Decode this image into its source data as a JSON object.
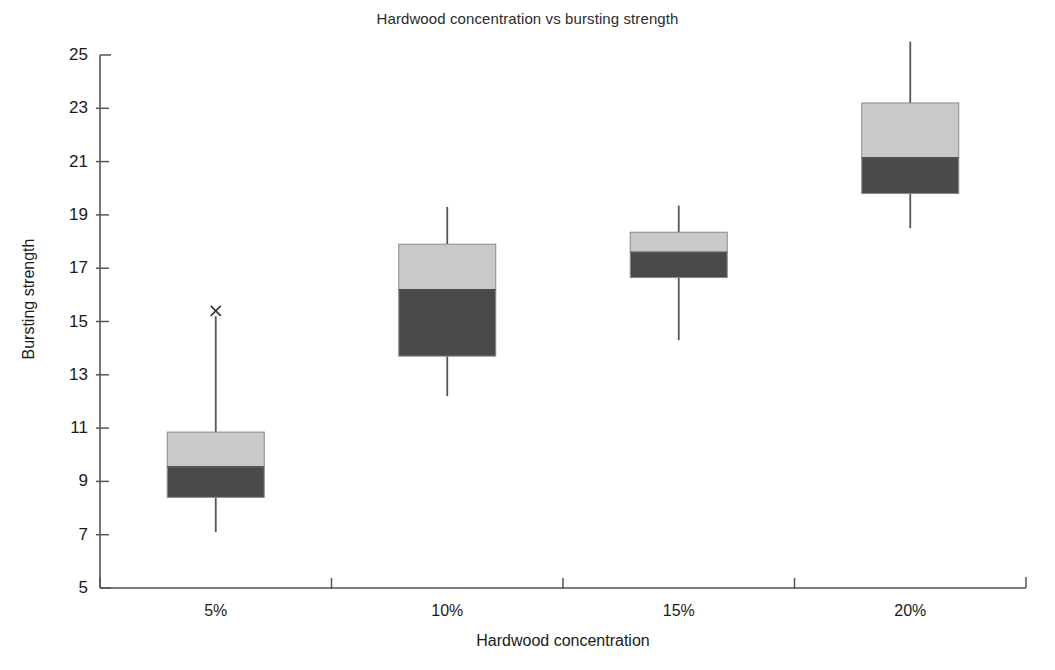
{
  "chart_data": {
    "type": "box",
    "title": "Hardwood concentration vs bursting strength",
    "xlabel": "Hardwood concentration",
    "ylabel": "Bursting strength",
    "categories": [
      "5%",
      "10%",
      "15%",
      "20%"
    ],
    "ylim": [
      5,
      25
    ],
    "ytick_values": [
      5,
      7,
      9,
      11,
      13,
      15,
      17,
      19,
      21,
      23,
      25
    ],
    "ytick_labels": [
      "5",
      "7",
      "9",
      "11",
      "13",
      "15",
      "17",
      "19",
      "21",
      "23",
      "25"
    ],
    "grid": false,
    "legend": "none",
    "colors": {
      "upper_box_fill": "#c9c9c9",
      "lower_box_fill": "#4a4a4a",
      "box_edge": "#8a8a8a",
      "whisker": "#555555",
      "axis": "#555555",
      "outlier": "#333333"
    },
    "boxes": [
      {
        "category": "5%",
        "whisker_low": 7.1,
        "q1": 8.4,
        "median": 9.55,
        "q3": 10.85,
        "whisker_high": 15.2,
        "outliers": [
          15.4
        ]
      },
      {
        "category": "10%",
        "whisker_low": 12.2,
        "q1": 13.7,
        "median": 16.2,
        "q3": 17.9,
        "whisker_high": 19.3,
        "outliers": []
      },
      {
        "category": "15%",
        "whisker_low": 14.3,
        "q1": 16.65,
        "median": 17.6,
        "q3": 18.35,
        "whisker_high": 19.35,
        "outliers": []
      },
      {
        "category": "20%",
        "whisker_low": 18.5,
        "q1": 19.8,
        "median": 21.15,
        "q3": 23.2,
        "whisker_high": 25.5,
        "outliers": []
      }
    ]
  }
}
